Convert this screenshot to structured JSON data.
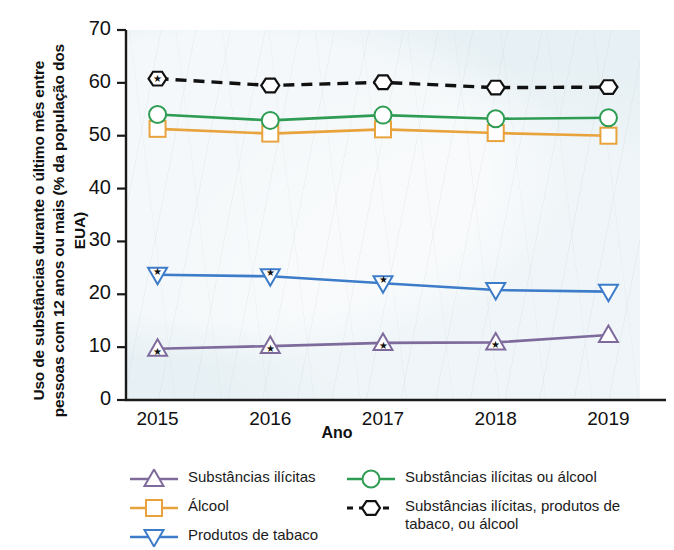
{
  "chart_data": {
    "type": "line",
    "title": "",
    "xlabel": "Ano",
    "ylabel": "Uso de substâncias durante o último mês entre pessoas com 12 anos ou mais (% da população dos EUA)",
    "categories": [
      "2015",
      "2016",
      "2017",
      "2018",
      "2019"
    ],
    "x": [
      2015,
      2016,
      2017,
      2018,
      2019
    ],
    "xlim": [
      2014.72,
      2019.28
    ],
    "ylim": [
      0,
      70
    ],
    "yticks": [
      0,
      10,
      20,
      30,
      40,
      50,
      60,
      70
    ],
    "grid": false,
    "legend_position": "bottom",
    "plot_background": "#e7f0f4",
    "series": [
      {
        "name": "Substâncias ilícitas",
        "values": [
          9.7,
          10.2,
          10.8,
          10.9,
          12.3
        ],
        "color": "#7e6b9c",
        "marker": "triangle-up",
        "linestyle": "solid"
      },
      {
        "name": "Álcool",
        "values": [
          51.3,
          50.4,
          51.2,
          50.5,
          50.0
        ],
        "color": "#e8a33d",
        "marker": "square",
        "linestyle": "solid"
      },
      {
        "name": "Produtos de tabaco",
        "values": [
          23.7,
          23.4,
          22.1,
          20.8,
          20.5
        ],
        "color": "#3d7cc9",
        "marker": "triangle-down",
        "linestyle": "solid"
      },
      {
        "name": "Substâncias ilícitas ou álcool",
        "values": [
          54.0,
          52.9,
          53.9,
          53.2,
          53.4
        ],
        "color": "#2e9c52",
        "marker": "circle",
        "linestyle": "solid"
      },
      {
        "name": "Substâncias ilícitas, produtos de tabaco, ou álcool",
        "values": [
          60.8,
          59.5,
          60.1,
          59.1,
          59.2
        ],
        "color": "#111111",
        "marker": "hexagon",
        "linestyle": "dashed"
      }
    ]
  },
  "legend": {
    "items": [
      {
        "label": "Substâncias ilícitas",
        "color": "#7e6b9c",
        "marker": "triangle-up-icon",
        "dashed": false
      },
      {
        "label": "Álcool",
        "color": "#e8a33d",
        "marker": "square-icon",
        "dashed": false
      },
      {
        "label": "Produtos de tabaco",
        "color": "#3d7cc9",
        "marker": "triangle-down-icon",
        "dashed": false
      },
      {
        "label": "Substâncias ilícitas ou álcool",
        "color": "#2e9c52",
        "marker": "circle-icon",
        "dashed": false
      },
      {
        "label": "Substâncias ilícitas, produtos de tabaco, ou álcool",
        "color": "#111111",
        "marker": "hexagon-icon",
        "dashed": true
      }
    ]
  }
}
